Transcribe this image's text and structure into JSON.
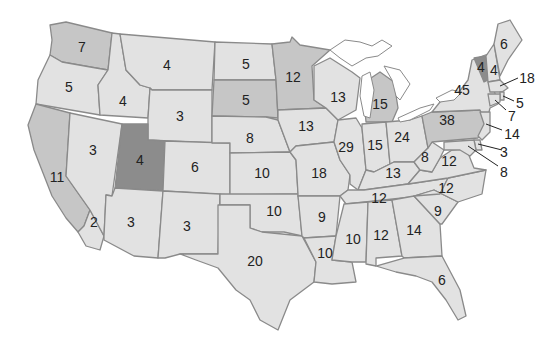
{
  "colors": {
    "light": "#e2e2e2",
    "medium": "#c6c6c6",
    "dark": "#8c8c8c",
    "border": "#8a8a8a",
    "text": "#222222"
  },
  "states": [
    {
      "id": "WA",
      "value": "7",
      "shade": "medium"
    },
    {
      "id": "OR",
      "value": "5",
      "shade": "light"
    },
    {
      "id": "CA_north",
      "value": "11",
      "shade": "medium"
    },
    {
      "id": "CA_south",
      "value": "2",
      "shade": "light"
    },
    {
      "id": "ID",
      "value": "4",
      "shade": "light"
    },
    {
      "id": "NV",
      "value": "3",
      "shade": "light"
    },
    {
      "id": "MT",
      "value": "4",
      "shade": "light"
    },
    {
      "id": "WY",
      "value": "3",
      "shade": "light"
    },
    {
      "id": "UT",
      "value": "4",
      "shade": "dark"
    },
    {
      "id": "AZ",
      "value": "3",
      "shade": "light"
    },
    {
      "id": "CO",
      "value": "6",
      "shade": "light"
    },
    {
      "id": "NM",
      "value": "3",
      "shade": "light"
    },
    {
      "id": "ND",
      "value": "5",
      "shade": "light"
    },
    {
      "id": "SD",
      "value": "5",
      "shade": "medium"
    },
    {
      "id": "NE",
      "value": "8",
      "shade": "light"
    },
    {
      "id": "KS",
      "value": "10",
      "shade": "light"
    },
    {
      "id": "OK",
      "value": "10",
      "shade": "light"
    },
    {
      "id": "TX",
      "value": "20",
      "shade": "light"
    },
    {
      "id": "MN",
      "value": "12",
      "shade": "medium"
    },
    {
      "id": "IA",
      "value": "13",
      "shade": "light"
    },
    {
      "id": "MO",
      "value": "18",
      "shade": "light"
    },
    {
      "id": "AR",
      "value": "9",
      "shade": "light"
    },
    {
      "id": "LA",
      "value": "10",
      "shade": "light"
    },
    {
      "id": "WI",
      "value": "13",
      "shade": "light"
    },
    {
      "id": "IL",
      "value": "29",
      "shade": "light"
    },
    {
      "id": "MI",
      "value": "15",
      "shade": "medium"
    },
    {
      "id": "IN",
      "value": "15",
      "shade": "light"
    },
    {
      "id": "OH",
      "value": "24",
      "shade": "light"
    },
    {
      "id": "KY",
      "value": "13",
      "shade": "light"
    },
    {
      "id": "TN",
      "value": "12",
      "shade": "light"
    },
    {
      "id": "MS",
      "value": "10",
      "shade": "light"
    },
    {
      "id": "AL",
      "value": "12",
      "shade": "light"
    },
    {
      "id": "GA",
      "value": "14",
      "shade": "light"
    },
    {
      "id": "FL",
      "value": "6",
      "shade": "light"
    },
    {
      "id": "SC",
      "value": "9",
      "shade": "light"
    },
    {
      "id": "NC",
      "value": "12",
      "shade": "light"
    },
    {
      "id": "VA",
      "value": "12",
      "shade": "light"
    },
    {
      "id": "WV",
      "value": "8",
      "shade": "light"
    },
    {
      "id": "PA",
      "value": "38",
      "shade": "medium"
    },
    {
      "id": "NY",
      "value": "45",
      "shade": "light"
    },
    {
      "id": "VT",
      "value": "4",
      "shade": "dark"
    },
    {
      "id": "NH",
      "value": "4",
      "shade": "light"
    },
    {
      "id": "ME",
      "value": "6",
      "shade": "light"
    },
    {
      "id": "MA",
      "value": "18",
      "shade": "light"
    },
    {
      "id": "RI",
      "value": "5",
      "shade": "light"
    },
    {
      "id": "CT",
      "value": "7",
      "shade": "light"
    },
    {
      "id": "NJ",
      "value": "14",
      "shade": "light"
    },
    {
      "id": "DE",
      "value": "3",
      "shade": "light"
    },
    {
      "id": "MD",
      "value": "8",
      "shade": "light"
    }
  ],
  "labels": {
    "WA": "7",
    "OR": "5",
    "CA_north": "11",
    "CA_south": "2",
    "ID": "4",
    "NV": "3",
    "MT": "4",
    "WY": "3",
    "UT": "4",
    "AZ": "3",
    "CO": "6",
    "NM": "3",
    "ND": "5",
    "SD": "5",
    "NE": "8",
    "KS": "10",
    "OK": "10",
    "TX": "20",
    "MN": "12",
    "IA": "13",
    "MO": "18",
    "AR": "9",
    "LA": "10",
    "WI": "13",
    "IL": "29",
    "MI": "15",
    "IN": "15",
    "OH": "24",
    "KY": "13",
    "TN": "12",
    "MS": "10",
    "AL": "12",
    "GA": "14",
    "FL": "6",
    "SC": "9",
    "NC": "12",
    "VA": "12",
    "WV": "8",
    "PA": "38",
    "NY": "45",
    "VT": "4",
    "NH": "4",
    "ME": "6",
    "MA": "18",
    "RI": "5",
    "CT": "7",
    "NJ": "14",
    "DE": "3",
    "MD": "8"
  }
}
